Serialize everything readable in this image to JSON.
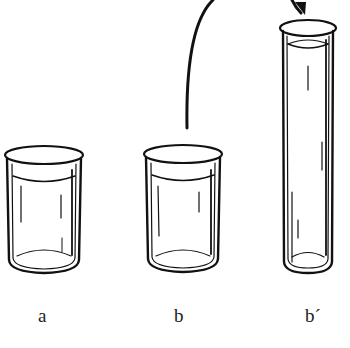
{
  "figure": {
    "stroke_color": "#111111",
    "background": "#ffffff"
  },
  "containers": [
    {
      "id": "a",
      "label": "a",
      "type": "beaker"
    },
    {
      "id": "b",
      "label": "b",
      "type": "beaker"
    },
    {
      "id": "b_prime",
      "label": "b´",
      "type": "tall-cylinder"
    }
  ],
  "arrow": {
    "from": "b",
    "to": "b_prime",
    "meaning": "pour"
  }
}
